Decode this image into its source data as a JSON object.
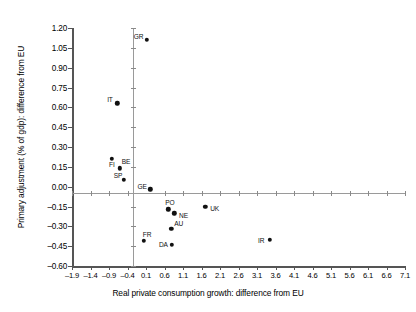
{
  "chart_data": {
    "type": "scatter",
    "title": "",
    "xlabel": "Real private consumption growth: difference from EU",
    "ylabel": "Primary adjustment (% of gdp): difference from EU",
    "xlim": [
      -1.9,
      7.1
    ],
    "ylim": [
      -0.6,
      1.2
    ],
    "xticks": [
      "-1.9",
      "-1.4",
      "-0.9",
      "-0.4",
      "0.1",
      "0.6",
      "1.1",
      "1.6",
      "2.1",
      "2.6",
      "3.1",
      "3.6",
      "4.1",
      "4.6",
      "5.1",
      "5.6",
      "6.1",
      "6.6",
      "7.1"
    ],
    "xtick_values": [
      -1.9,
      -1.4,
      -0.9,
      -0.4,
      0.1,
      0.6,
      1.1,
      1.6,
      2.1,
      2.6,
      3.1,
      3.6,
      4.1,
      4.6,
      5.1,
      5.6,
      6.1,
      6.6,
      7.1
    ],
    "yticks": [
      "1.20",
      "1.05",
      "0.90",
      "0.75",
      "0.60",
      "0.45",
      "0.30",
      "0.15",
      "0.00",
      "-0.15",
      "-0.30",
      "-0.45",
      "-0.60"
    ],
    "ytick_values": [
      1.2,
      1.05,
      0.9,
      0.75,
      0.6,
      0.45,
      0.3,
      0.15,
      0.0,
      -0.15,
      -0.3,
      -0.45,
      -0.6
    ],
    "grid": false,
    "legend": "none",
    "zero_lines": true,
    "marker_color": "#111111",
    "points": [
      {
        "label": "GR",
        "x": 0.12,
        "y": 1.11,
        "label_dx": -13,
        "label_dy": -7
      },
      {
        "label": "IT",
        "x": -0.68,
        "y": 0.63,
        "label_dx": -10,
        "label_dy": -7
      },
      {
        "label": "BE",
        "x": -0.61,
        "y": 0.14,
        "label_dx": 2,
        "label_dy": -10
      },
      {
        "label": "FI",
        "x": -0.82,
        "y": 0.21,
        "label_dx": -3,
        "label_dy": 2
      },
      {
        "label": "SP",
        "x": -0.5,
        "y": 0.05,
        "label_dx": -10,
        "label_dy": -8
      },
      {
        "label": "GE",
        "x": 0.22,
        "y": -0.02,
        "label_dx": -13,
        "label_dy": -6
      },
      {
        "label": "PO",
        "x": 0.7,
        "y": -0.17,
        "label_dx": -3,
        "label_dy": -10
      },
      {
        "label": "NE",
        "x": 0.86,
        "y": -0.2,
        "label_dx": 5,
        "label_dy": -1
      },
      {
        "label": "UK",
        "x": 1.7,
        "y": -0.15,
        "label_dx": 5,
        "label_dy": -2
      },
      {
        "label": "AU",
        "x": 0.78,
        "y": -0.32,
        "label_dx": 3,
        "label_dy": -9
      },
      {
        "label": "FR",
        "x": 0.04,
        "y": -0.41,
        "label_dx": -1,
        "label_dy": -10
      },
      {
        "label": "DA",
        "x": 0.8,
        "y": -0.44,
        "label_dx": -13,
        "label_dy": -4
      },
      {
        "label": "IR",
        "x": 3.45,
        "y": -0.4,
        "label_dx": -12,
        "label_dy": -3
      }
    ]
  }
}
